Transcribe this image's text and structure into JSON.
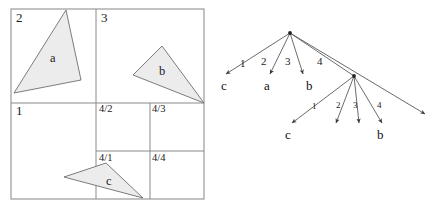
{
  "figure": {
    "stipple_color": "#ececec",
    "line_color": "#8a8a8a"
  },
  "quadtree": {
    "quadrant_labels": [
      {
        "text": "2",
        "x": 16,
        "y": 22
      },
      {
        "text": "3",
        "x": 101,
        "y": 22
      },
      {
        "text": "1",
        "x": 16,
        "y": 115
      }
    ],
    "sub_labels": [
      {
        "text": "4/2",
        "x": 99,
        "y": 112
      },
      {
        "text": "4/3",
        "x": 152,
        "y": 112
      },
      {
        "text": "4/1",
        "x": 99,
        "y": 161
      },
      {
        "text": "4/4",
        "x": 152,
        "y": 161
      }
    ],
    "shapes": [
      {
        "name": "a",
        "points": "66,10 14,93 81,80",
        "label_x": 50,
        "label_y": 62
      },
      {
        "name": "b",
        "points": "162,46 133,75 204,103",
        "label_x": 159,
        "label_y": 75
      },
      {
        "name": "c",
        "points": "106,163 64,177 143,198",
        "label_x": 106,
        "label_y": 185
      }
    ]
  },
  "tree": {
    "root": {
      "x": 290,
      "y": 33
    },
    "second_level_node": {
      "x": 354,
      "y": 76
    },
    "level1_edges": [
      {
        "label": "1",
        "label_x": 243,
        "label_y": 64,
        "x2": 226,
        "y2": 74
      },
      {
        "label": "2",
        "label_x": 262,
        "label_y": 64,
        "x2": 270,
        "y2": 74
      },
      {
        "label": "3",
        "label_x": 285,
        "label_y": 64,
        "x2": 303,
        "y2": 74
      },
      {
        "label": "4",
        "label_x": 318,
        "label_y": 64,
        "x2": 354,
        "y2": 76
      }
    ],
    "level1_leaves": [
      {
        "label": "c",
        "x": 224,
        "y": 89
      },
      {
        "label": "a",
        "x": 266,
        "y": 89
      },
      {
        "label": "b",
        "x": 309,
        "y": 89
      }
    ],
    "level2_edges": [
      {
        "label": "1",
        "label_x": 314,
        "label_y": 107,
        "x2": 292,
        "y2": 123
      },
      {
        "label": "2",
        "label_x": 337,
        "label_y": 107,
        "x2": 336,
        "y2": 123
      },
      {
        "label": "3",
        "label_x": 354,
        "label_y": 107,
        "x2": 359,
        "y2": 123
      },
      {
        "label": "4",
        "label_x": 378,
        "label_y": 107,
        "x2": 382,
        "y2": 123
      },
      {
        "label": "",
        "label_x": 0,
        "label_y": 0,
        "x2": 425,
        "y2": 114
      }
    ],
    "level2_leaves": [
      {
        "label": "c",
        "x": 288,
        "y": 138
      },
      {
        "label": "b",
        "x": 380,
        "y": 138
      }
    ]
  }
}
